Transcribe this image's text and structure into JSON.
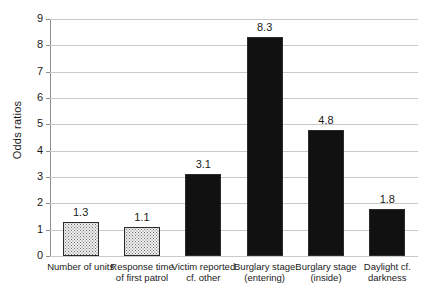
{
  "chart_data": {
    "type": "bar",
    "title": "",
    "xlabel": "",
    "ylabel": "Odds ratios",
    "ylim": [
      0,
      9
    ],
    "yticks": [
      0,
      1,
      2,
      3,
      4,
      5,
      6,
      7,
      8,
      9
    ],
    "ytick_labels": [
      "0",
      "1",
      "2",
      "3",
      "4",
      "5",
      "6",
      "7",
      "8",
      "9"
    ],
    "grid": true,
    "legend": "none",
    "categories": [
      "Number of units",
      "Response time\nof first patrol",
      "Victim reported\ncf. other",
      "Burglary stage\n(entering)",
      "Burglary stage\n(inside)",
      "Daylight cf.\ndarkness"
    ],
    "values": [
      1.3,
      1.1,
      3.1,
      8.3,
      4.8,
      1.8
    ],
    "value_labels": [
      "1.3",
      "1.1",
      "3.1",
      "8.3",
      "4.8",
      "1.8"
    ],
    "bar_styles": [
      "light",
      "light",
      "dark",
      "dark",
      "dark",
      "dark"
    ],
    "colors": {
      "light_fill": "#f2f2f2",
      "dark_fill": "#3a3a3a",
      "bar_border": "#2b2b2b",
      "gridline": "#c9c9c9",
      "axis": "#8d8d8d",
      "text": "#1a1a1a",
      "background": "#ffffff"
    }
  }
}
